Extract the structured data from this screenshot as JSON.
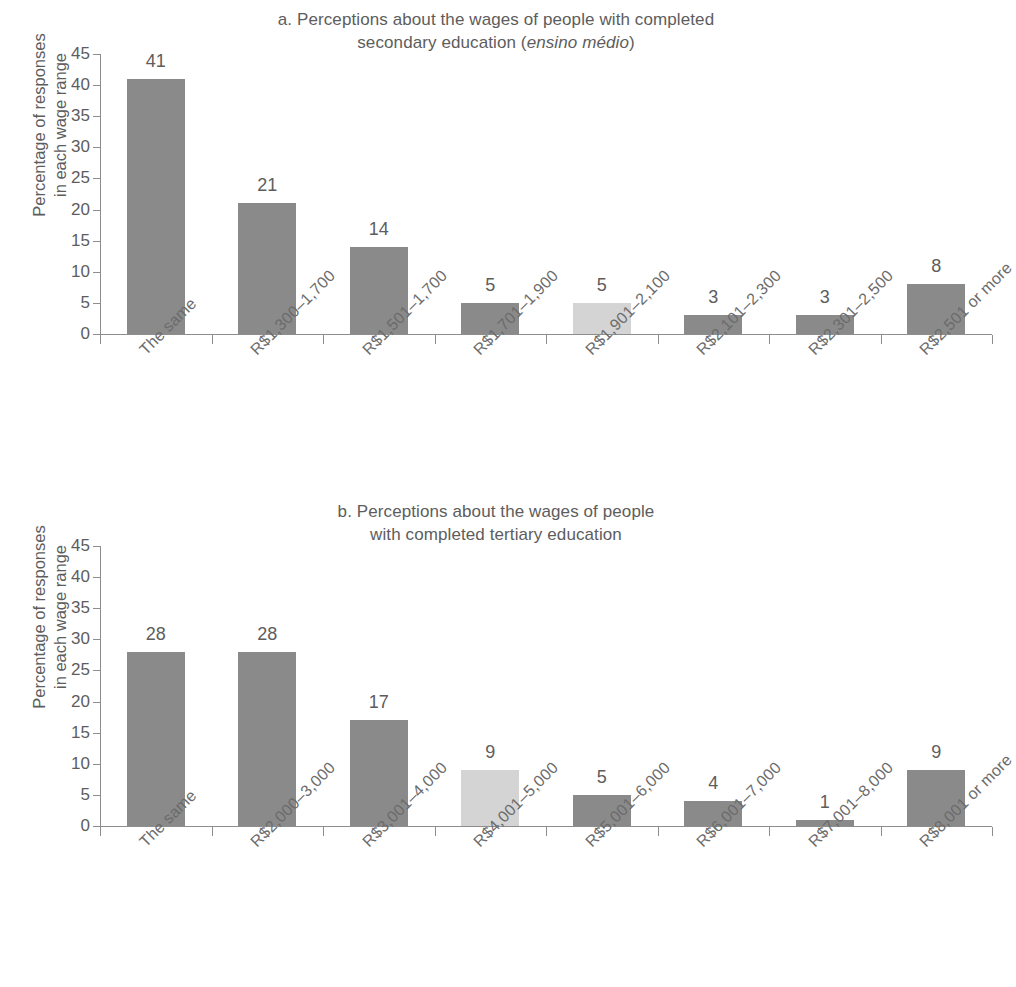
{
  "chart_data": [
    {
      "id": "a",
      "type": "bar",
      "title": "a. Perceptions about the wages of people with completed secondary education (ensino médio)",
      "title_line1": "a. Perceptions about the wages of people with completed",
      "title_line2_pre": "secondary education (",
      "title_line2_italic": "ensino médio",
      "title_line2_post": ")",
      "xlabel": "",
      "ylabel": "Percentage of responses\nin each wage range",
      "ylim": [
        0,
        45
      ],
      "yticks": [
        0,
        5,
        10,
        15,
        20,
        25,
        30,
        35,
        40,
        45
      ],
      "grid": false,
      "legend": "none",
      "categories": [
        "The same",
        "R$1,300–1,700",
        "R$1,501–1,700",
        "R$1,701–1,900",
        "R$1,901–2,100",
        "R$2,101–2,300",
        "R$2,301–2,500",
        "R$2,501 or more"
      ],
      "values": [
        41,
        21,
        14,
        5,
        5,
        3,
        3,
        8
      ],
      "highlight_index": 4,
      "bar_color": "#8a8a8a",
      "highlight_color": "#d4d4d4"
    },
    {
      "id": "b",
      "type": "bar",
      "title": "b. Perceptions about the wages of people with completed tertiary education",
      "title_line1": "b. Perceptions about the wages of people",
      "title_line2_pre": "with completed tertiary education",
      "title_line2_italic": "",
      "title_line2_post": "",
      "xlabel": "",
      "ylabel": "Percentage of responses\nin each wage range",
      "ylim": [
        0,
        45
      ],
      "yticks": [
        0,
        5,
        10,
        15,
        20,
        25,
        30,
        35,
        40,
        45
      ],
      "grid": false,
      "legend": "none",
      "categories": [
        "The same",
        "R$2,000–3,000",
        "R$3,001–4,000",
        "R$4,001–5,000",
        "R$5,001–6,000",
        "R$6,001–7,000",
        "R$7,001–8,000",
        "R$8,001 or more"
      ],
      "values": [
        28,
        28,
        17,
        9,
        5,
        4,
        1,
        9
      ],
      "highlight_index": 3,
      "bar_color": "#8a8a8a",
      "highlight_color": "#d4d4d4"
    }
  ]
}
